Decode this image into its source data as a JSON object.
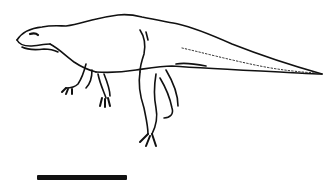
{
  "figure": {
    "style": "black ink line drawing on white",
    "pose": "bipedal, facing left, tail extended right",
    "colors": {
      "ink": "#111111",
      "background": "#ffffff"
    }
  },
  "scale_bar": {
    "label": ""
  }
}
